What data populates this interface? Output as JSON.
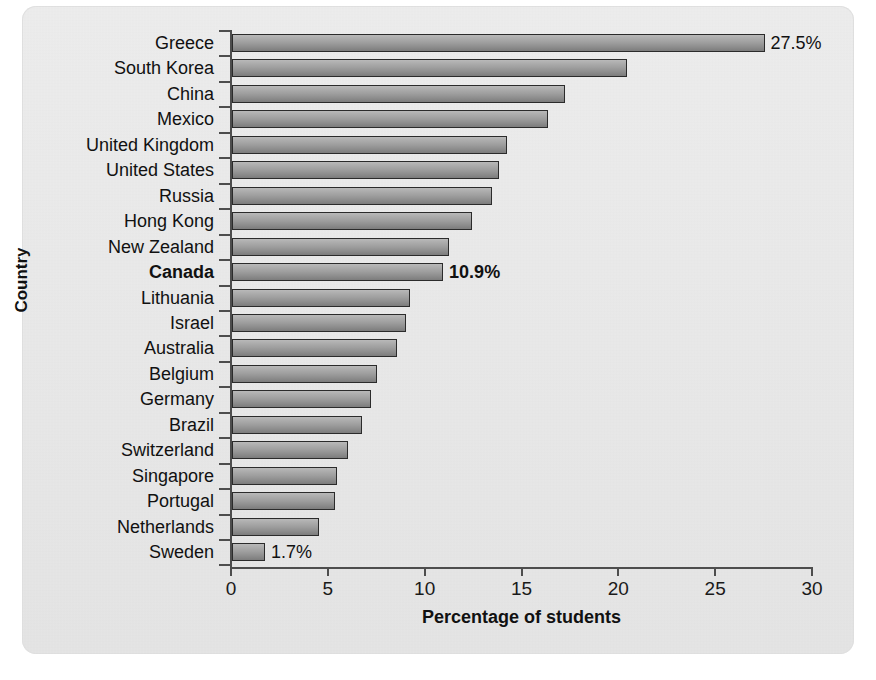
{
  "chart_data": {
    "type": "bar",
    "orientation": "horizontal",
    "title": "",
    "xlabel": "Percentage of students",
    "ylabel": "Country",
    "xlim": [
      0,
      30
    ],
    "xticks": [
      "0",
      "5",
      "10",
      "15",
      "20",
      "25",
      "30"
    ],
    "grid": false,
    "legend": null,
    "highlight_category": "Canada",
    "categories": [
      "Greece",
      "South Korea",
      "China",
      "Mexico",
      "United Kingdom",
      "United States",
      "Russia",
      "Hong Kong",
      "New Zealand",
      "Canada",
      "Lithuania",
      "Israel",
      "Australia",
      "Belgium",
      "Germany",
      "Brazil",
      "Switzerland",
      "Singapore",
      "Portugal",
      "Netherlands",
      "Sweden"
    ],
    "values": [
      27.5,
      20.4,
      17.2,
      16.3,
      14.2,
      13.8,
      13.4,
      12.4,
      11.2,
      10.9,
      9.2,
      9.0,
      8.5,
      7.5,
      7.2,
      6.7,
      6.0,
      5.4,
      5.3,
      4.5,
      1.7
    ],
    "data_labels": {
      "Greece": "27.5%",
      "Canada": "10.9%",
      "Sweden": "1.7%"
    },
    "colors": {
      "bar_fill_top": "#b9b9b9",
      "bar_fill_bottom": "#7c7c7c",
      "bar_border": "#2b2b2b",
      "panel_background": "#ebebeb",
      "axis": "#4d4d4d",
      "text": "#111111"
    }
  }
}
